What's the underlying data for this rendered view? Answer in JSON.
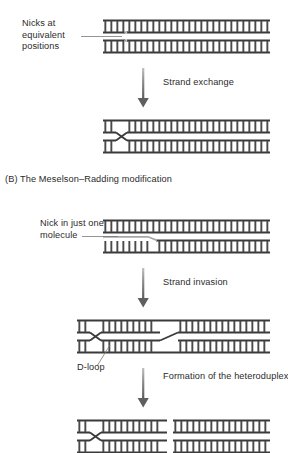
{
  "figure": {
    "panel_b_heading": "(B) The Meselson–Radding modification",
    "labels": {
      "nicks_equivalent": "Nicks at equivalent positions",
      "nick_one_molecule": "Nick in just one molecule",
      "d_loop": "D-loop"
    },
    "arrows": [
      {
        "label": "Strand exchange"
      },
      {
        "label": "Strand invasion"
      },
      {
        "label": "Formation of the heteroduplex"
      }
    ],
    "colors": {
      "ink": "#2b2b2b",
      "dna_rail": "#3a3a3a",
      "dna_rung": "#4a4a4a",
      "background": "#ffffff",
      "arrow": "#6e6e6e",
      "leader": "#7a7a7a"
    },
    "steps": [
      {
        "name": "two-duplexes-with-nicks",
        "description": "Two aligned DNA duplexes each carrying a nick at equivalent positions"
      },
      {
        "name": "strand-exchange-crossover",
        "description": "Two duplexes joined by a single reciprocal strand crossover"
      },
      {
        "name": "single-nicked-duplex",
        "description": "Upper intact duplex above a duplex with a nick and displaced single strand"
      },
      {
        "name": "d-loop-intermediate",
        "description": "Invading strand paired with recipient duplex forming a D-loop"
      },
      {
        "name": "heteroduplex-joint",
        "description": "Joint molecule with heteroduplex region and crossover"
      }
    ]
  }
}
